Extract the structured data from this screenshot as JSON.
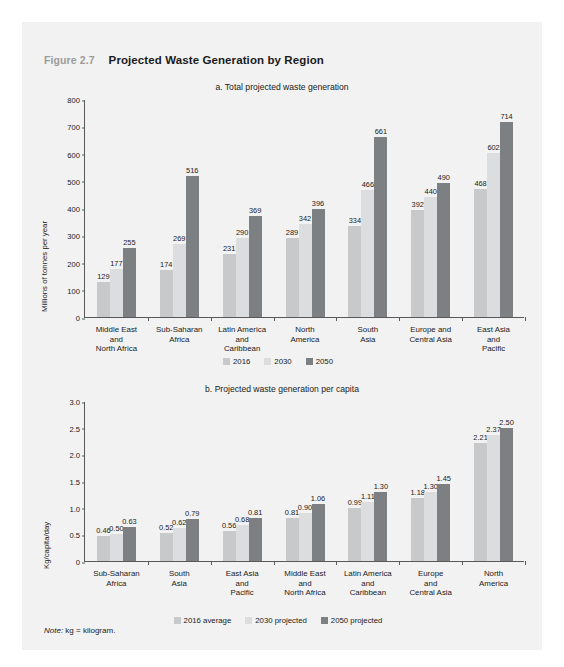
{
  "figure": {
    "number": "Figure 2.7",
    "title": "Projected Waste Generation by Region",
    "note_label": "Note:",
    "note_text": " kg = kilogram."
  },
  "colors": {
    "series_2016": "#c7c9cb",
    "series_2030": "#dcdddf",
    "series_2050": "#7d8083",
    "axis": "#58585a",
    "panel_bg": "#f2f2f2",
    "title_gray": "#9b9b9b",
    "text": "#1a1a1a"
  },
  "chart_data": [
    {
      "type": "bar",
      "id": "panel-a",
      "title": "a. Total projected waste generation",
      "xlabel": "",
      "ylabel": "Millions of tonnes per year",
      "ylim": [
        0,
        800
      ],
      "yticks": [
        "0",
        "100",
        "200",
        "300",
        "400",
        "500",
        "600",
        "700",
        "800"
      ],
      "grid": false,
      "legend_position": "bottom",
      "categories": [
        "Middle East and North Africa",
        "Sub-Saharan Africa",
        "Latin America and Caribbean",
        "North America",
        "South Asia",
        "Europe and Central Asia",
        "East Asia and Pacific"
      ],
      "category_lines": [
        [
          "Middle East",
          "and",
          "North Africa"
        ],
        [
          "Sub-Saharan",
          "Africa"
        ],
        [
          "Latin America",
          "and",
          "Caribbean"
        ],
        [
          "North",
          "America"
        ],
        [
          "South",
          "Asia"
        ],
        [
          "Europe and",
          "Central Asia"
        ],
        [
          "East Asia",
          "and",
          "Pacific"
        ]
      ],
      "series": [
        {
          "name": "2016",
          "color": "#c7c9cb",
          "values": [
            129,
            174,
            231,
            289,
            334,
            392,
            468
          ]
        },
        {
          "name": "2030",
          "color": "#dcdddf",
          "values": [
            177,
            269,
            290,
            342,
            466,
            440,
            602
          ]
        },
        {
          "name": "2050",
          "color": "#7d8083",
          "values": [
            255,
            516,
            369,
            396,
            661,
            490,
            714
          ]
        }
      ]
    },
    {
      "type": "bar",
      "id": "panel-b",
      "title": "b. Projected waste generation per capita",
      "xlabel": "",
      "ylabel": "Kg/capita/day",
      "ylim": [
        0,
        3.0
      ],
      "yticks": [
        "0",
        "0.5",
        "1.0",
        "1.5",
        "2.0",
        "2.5",
        "3.0"
      ],
      "grid": false,
      "legend_position": "bottom",
      "categories": [
        "Sub-Saharan Africa",
        "South Asia",
        "East Asia and Pacific",
        "Middle East and North Africa",
        "Latin America and Caribbean",
        "Europe and Central Asia",
        "North America"
      ],
      "category_lines": [
        [
          "Sub-Saharan",
          "Africa"
        ],
        [
          "South",
          "Asia"
        ],
        [
          "East Asia",
          "and",
          "Pacific"
        ],
        [
          "Middle East",
          "and",
          "North Africa"
        ],
        [
          "Latin America",
          "and",
          "Caribbean"
        ],
        [
          "Europe",
          "and",
          "Central Asia"
        ],
        [
          "North",
          "America"
        ]
      ],
      "series": [
        {
          "name": "2016 average",
          "color": "#c7c9cb",
          "values": [
            0.46,
            0.52,
            0.56,
            0.81,
            0.99,
            1.18,
            2.21
          ]
        },
        {
          "name": "2030 projected",
          "color": "#dcdddf",
          "values": [
            0.5,
            0.62,
            0.68,
            0.9,
            1.11,
            1.3,
            2.37
          ]
        },
        {
          "name": "2050 projected",
          "color": "#7d8083",
          "values": [
            0.63,
            0.79,
            0.81,
            1.06,
            1.3,
            1.45,
            2.5
          ]
        }
      ],
      "value_labels": [
        [
          "0.46",
          "0.50",
          "0.63"
        ],
        [
          "0.52",
          "0.62",
          "0.79"
        ],
        [
          "0.56",
          "0.68",
          "0.81"
        ],
        [
          "0.81",
          "0.90",
          "1.06"
        ],
        [
          "0.99",
          "1.11",
          "1.30"
        ],
        [
          "1.18",
          "1.30",
          "1.45"
        ],
        [
          "2.21",
          "2.37",
          "2.50"
        ]
      ]
    }
  ]
}
